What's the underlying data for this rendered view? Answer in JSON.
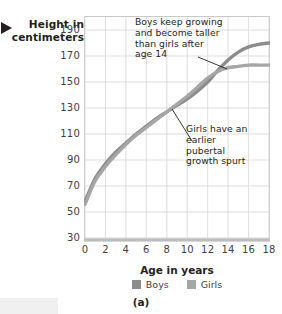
{
  "figure": {
    "caption": "(a)",
    "axis_label_y": "Height in centimeters",
    "axis_label_x": "Age in years"
  },
  "annotations": {
    "boys": "Boys keep growing and become taller than girls after age 14",
    "girls": "Girls have an earlier pubertal growth spurt"
  },
  "legend": {
    "items": [
      {
        "label": "Boys",
        "color": "#8c8c8c"
      },
      {
        "label": "Girls",
        "color": "#a6a6a6"
      }
    ]
  },
  "chart_data": {
    "type": "line",
    "title": "",
    "xlabel": "Age in years",
    "ylabel": "Height in centimeters",
    "xlim": [
      0,
      18
    ],
    "ylim": [
      30,
      200
    ],
    "xticks": [
      0,
      2,
      4,
      6,
      8,
      10,
      12,
      14,
      16,
      18
    ],
    "yticks": [
      30,
      50,
      70,
      90,
      110,
      130,
      150,
      170,
      190
    ],
    "grid": true,
    "legend_position": "bottom-center",
    "x": [
      0,
      1,
      2,
      3,
      4,
      5,
      6,
      7,
      8,
      9,
      10,
      11,
      12,
      13,
      14,
      15,
      16,
      17,
      18
    ],
    "series": [
      {
        "name": "Boys",
        "color": "#8c8c8c",
        "values": [
          58,
          76,
          87,
          96,
          103,
          110,
          116,
          122,
          127,
          132,
          137,
          143,
          150,
          159,
          167,
          173,
          177,
          179,
          180
        ]
      },
      {
        "name": "Girls",
        "color": "#a6a6a6",
        "values": [
          56,
          74,
          85,
          94,
          102,
          109,
          115,
          121,
          127,
          133,
          139,
          146,
          153,
          158,
          161,
          162,
          163,
          163,
          163
        ]
      }
    ],
    "annotations": [
      {
        "text": "Boys keep growing and become taller than girls after age 14",
        "points_to_x": 15.2,
        "points_to_y": 173
      },
      {
        "text": "Girls have an earlier pubertal growth spurt",
        "points_to_x": 11.2,
        "points_to_y": 146
      }
    ]
  }
}
